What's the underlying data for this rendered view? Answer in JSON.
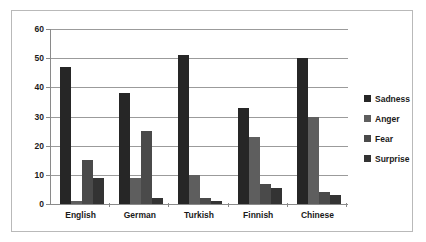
{
  "chart_data": {
    "type": "bar",
    "title": "",
    "xlabel": "",
    "ylabel": "",
    "ylim": [
      0,
      60
    ],
    "yticks": [
      0,
      10,
      20,
      30,
      40,
      50,
      60
    ],
    "grid": true,
    "legend_position": "right",
    "categories": [
      "English",
      "German",
      "Turkish",
      "Finnish",
      "Chinese"
    ],
    "series": [
      {
        "name": "Sadness",
        "color": "#262626",
        "values": [
          47,
          38,
          51,
          33,
          50
        ]
      },
      {
        "name": "Anger",
        "color": "#5e5e5e",
        "values": [
          1,
          9,
          10,
          23,
          30
        ]
      },
      {
        "name": "Fear",
        "color": "#4a4a4a",
        "values": [
          15,
          25,
          2,
          7,
          4
        ]
      },
      {
        "name": "Surprise",
        "color": "#333333",
        "values": [
          9,
          2,
          1,
          5.5,
          3
        ]
      }
    ]
  },
  "axis": {
    "ytick_labels": [
      "0",
      "10",
      "20",
      "30",
      "40",
      "50",
      "60"
    ]
  },
  "legend": {
    "items": [
      {
        "label": "Sadness"
      },
      {
        "label": "Anger"
      },
      {
        "label": "Fear"
      },
      {
        "label": "Surprise"
      }
    ]
  }
}
